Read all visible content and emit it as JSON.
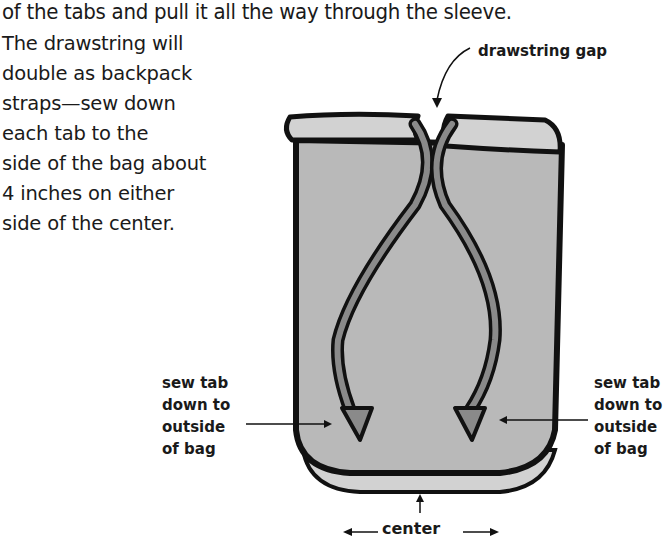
{
  "text": {
    "intro": "of the tabs and pull it all the way through the sleeve.",
    "paragraph_lines": [
      "The drawstring will",
      "double as backpack",
      "straps—sew down",
      "each tab to the",
      "side of the bag about",
      "4 inches on either",
      "side of the center."
    ]
  },
  "figure": {
    "labels": {
      "drawstring_gap": "drawstring gap",
      "sew_left": [
        "sew tab",
        "down to",
        "outside",
        "of bag"
      ],
      "sew_right": [
        "sew tab",
        "down to",
        "outside",
        "of bag"
      ],
      "center": "center"
    },
    "colors": {
      "bag_fill": "#b9b9b9",
      "bag_light": "#d2d2d2",
      "strap_fill": "#8a8a8a",
      "outline": "#111111"
    }
  }
}
